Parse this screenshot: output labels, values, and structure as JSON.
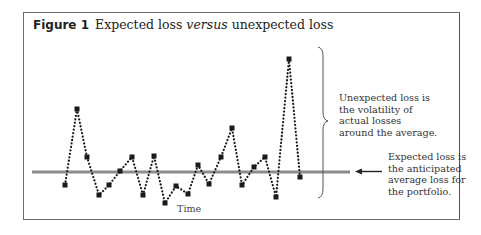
{
  "figure": {
    "number_label": "Figure 1",
    "title_part1": "Expected loss ",
    "title_italic": "versus",
    "title_part2": " unexpected loss"
  },
  "annotations": {
    "unexpected_loss": [
      "Unexpected loss is",
      "the volatility of",
      "actual losses",
      "around the average."
    ],
    "expected_loss": [
      "Expected loss is",
      "the anticipated",
      "average loss for",
      "the portfolio."
    ]
  },
  "axis": {
    "xlabel": "Time"
  },
  "colors": {
    "expected_line": "#8c8c8c",
    "series": "#1a1a1a",
    "frame": "#6e6e6e"
  },
  "chart_data": {
    "type": "line",
    "title": "Expected loss versus unexpected loss",
    "xlabel": "Time",
    "ylabel": "",
    "grid": false,
    "series": [
      {
        "name": "Actual losses",
        "style": "dotted with square markers",
        "points_px": [
          [
            65,
            185
          ],
          [
            77,
            109
          ],
          [
            87,
            157
          ],
          [
            99,
            195
          ],
          [
            109,
            185
          ],
          [
            120,
            171
          ],
          [
            132,
            157
          ],
          [
            143,
            195
          ],
          [
            154,
            156
          ],
          [
            165,
            203
          ],
          [
            176,
            186
          ],
          [
            188,
            194
          ],
          [
            198,
            165
          ],
          [
            209,
            184
          ],
          [
            221,
            157
          ],
          [
            232,
            128
          ],
          [
            242,
            185
          ],
          [
            254,
            167
          ],
          [
            265,
            157
          ],
          [
            276,
            197
          ],
          [
            289,
            59
          ],
          [
            300,
            177
          ]
        ]
      },
      {
        "name": "Expected loss (average)",
        "style": "solid horizontal line",
        "y_px": 172,
        "x_range_px": [
          32,
          350
        ]
      }
    ],
    "annotations": [
      "Unexpected loss is the volatility of actual losses around the average.",
      "Expected loss is the anticipated average loss for the portfolio."
    ]
  }
}
